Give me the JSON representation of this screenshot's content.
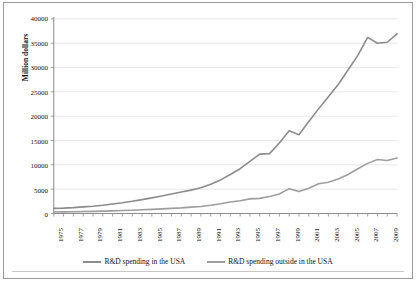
{
  "chart_data": {
    "type": "line",
    "title": "",
    "xlabel": "",
    "ylabel": "Million dollars",
    "ylim": [
      0,
      40000
    ],
    "xlim": [
      1975,
      2010
    ],
    "ytick_labels": [
      "0",
      "5000",
      "10000",
      "15000",
      "20000",
      "25000",
      "30000",
      "35000",
      "40000"
    ],
    "ytick_values": [
      0,
      5000,
      10000,
      15000,
      20000,
      25000,
      30000,
      35000,
      40000
    ],
    "xtick_labels": [
      "1975",
      "1977",
      "1979",
      "1981",
      "1983",
      "1985",
      "1987",
      "1989",
      "1991",
      "1993",
      "1995",
      "1997",
      "1999",
      "2001",
      "2003",
      "2005",
      "2007",
      "2009"
    ],
    "xtick_values": [
      1975,
      1977,
      1979,
      1981,
      1983,
      1985,
      1987,
      1989,
      1991,
      1993,
      1995,
      1997,
      1999,
      2001,
      2003,
      2005,
      2007,
      2009
    ],
    "grid": "horizontal",
    "legend_position": "bottom",
    "x": [
      1975,
      1976,
      1977,
      1978,
      1979,
      1980,
      1981,
      1982,
      1983,
      1984,
      1985,
      1986,
      1987,
      1988,
      1989,
      1990,
      1991,
      1992,
      1993,
      1994,
      1995,
      1996,
      1997,
      1998,
      1999,
      2000,
      2001,
      2002,
      2003,
      2004,
      2005,
      2006,
      2007,
      2008,
      2009,
      2010
    ],
    "series": [
      {
        "name": "R&D spending in the USA",
        "color": "#8c8c8c",
        "values": [
          1050,
          1100,
          1200,
          1350,
          1500,
          1700,
          1950,
          2200,
          2500,
          2850,
          3200,
          3600,
          4000,
          4400,
          4800,
          5300,
          6000,
          6900,
          8000,
          9200,
          10700,
          12200,
          12300,
          14500,
          17000,
          16200,
          18900,
          21500,
          24000,
          26500,
          29500,
          32500,
          36200,
          35000,
          35200,
          36900
        ]
      },
      {
        "name": "R&D spending outside in the USA",
        "color": "#9e9e9e",
        "values": [
          300,
          320,
          350,
          390,
          430,
          480,
          540,
          600,
          670,
          750,
          840,
          940,
          1050,
          1150,
          1300,
          1450,
          1700,
          2000,
          2350,
          2600,
          3000,
          3100,
          3500,
          4000,
          5100,
          4500,
          5200,
          6100,
          6400,
          7100,
          8000,
          9200,
          10300,
          11100,
          10900,
          11400
        ]
      }
    ]
  },
  "legend": {
    "items": [
      {
        "label": "R&D spending in the USA"
      },
      {
        "label": "R&D spending outside in the USA"
      }
    ]
  }
}
